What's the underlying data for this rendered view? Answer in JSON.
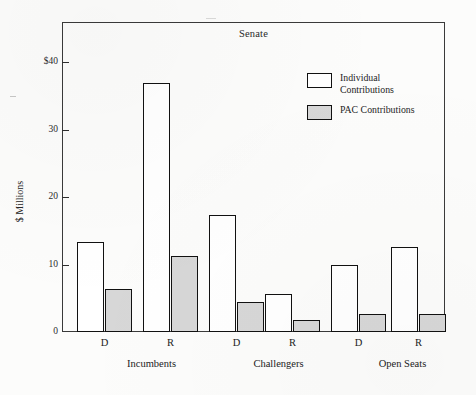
{
  "chart_data": {
    "type": "bar",
    "title": "Senate",
    "xlabel": "",
    "ylabel": "$ Millions",
    "ylim": [
      0,
      46
    ],
    "grid": false,
    "legend_position": "upper-right inside plot",
    "categories": [
      "D",
      "R",
      "D",
      "R",
      "D",
      "R"
    ],
    "groups": [
      {
        "label": "Incumbents",
        "categories": [
          "D",
          "R"
        ]
      },
      {
        "label": "Challengers",
        "categories": [
          "D",
          "R"
        ]
      },
      {
        "label": "Open Seats",
        "categories": [
          "D",
          "R"
        ]
      }
    ],
    "series": [
      {
        "name": "Individual Contributions",
        "color": "#ffffff",
        "values": [
          13.3,
          37.0,
          17.3,
          5.6,
          10.0,
          12.6
        ]
      },
      {
        "name": "PAC Contributions",
        "color": "#d7d7d7",
        "values": [
          6.4,
          11.3,
          4.4,
          1.8,
          2.7,
          2.6
        ]
      }
    ],
    "y_ticks": [
      {
        "value": 40,
        "label": "$40"
      },
      {
        "value": 30,
        "label": "30"
      },
      {
        "value": 20,
        "label": "20"
      },
      {
        "value": 10,
        "label": "10"
      },
      {
        "value": 0,
        "label": "0"
      }
    ],
    "legend": [
      {
        "label": "Individual\nContributions",
        "swatch": "individual"
      },
      {
        "label": "PAC Contributions",
        "swatch": "pac"
      }
    ]
  }
}
